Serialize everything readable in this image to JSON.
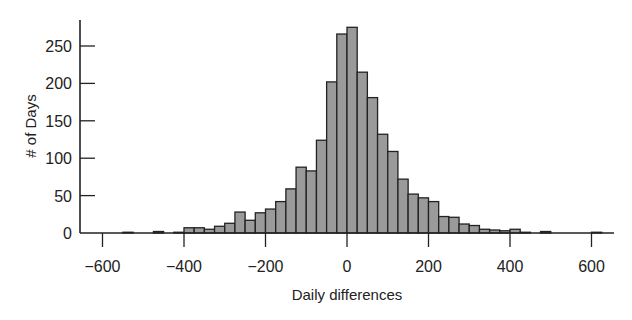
{
  "chart_data": {
    "type": "bar",
    "subtype": "histogram",
    "title": "",
    "xlabel": "Daily differences",
    "ylabel": "# of Days",
    "bin_width": 25,
    "xlim": [
      -650,
      650
    ],
    "ylim": [
      0,
      280
    ],
    "xticks": [
      -600,
      -400,
      -200,
      0,
      200,
      400,
      600
    ],
    "xtick_labels": [
      "−600",
      "−400",
      "−200",
      "0",
      "200",
      "400",
      "600"
    ],
    "yticks": [
      0,
      50,
      100,
      150,
      200,
      250
    ],
    "ytick_labels": [
      "0",
      "50",
      "100",
      "150",
      "200",
      "250"
    ],
    "grid": false,
    "legend": null,
    "bar_fill": "#9a9a9a",
    "bar_edge": "#222222",
    "bins": [
      {
        "start": -550,
        "end": -525,
        "count": 1
      },
      {
        "start": -475,
        "end": -450,
        "count": 2
      },
      {
        "start": -425,
        "end": -400,
        "count": 1
      },
      {
        "start": -400,
        "end": -375,
        "count": 7
      },
      {
        "start": -375,
        "end": -350,
        "count": 7
      },
      {
        "start": -350,
        "end": -325,
        "count": 5
      },
      {
        "start": -325,
        "end": -300,
        "count": 9
      },
      {
        "start": -300,
        "end": -275,
        "count": 13
      },
      {
        "start": -275,
        "end": -250,
        "count": 28
      },
      {
        "start": -250,
        "end": -225,
        "count": 17
      },
      {
        "start": -225,
        "end": -200,
        "count": 27
      },
      {
        "start": -200,
        "end": -175,
        "count": 32
      },
      {
        "start": -175,
        "end": -150,
        "count": 42
      },
      {
        "start": -150,
        "end": -125,
        "count": 59
      },
      {
        "start": -125,
        "end": -100,
        "count": 88
      },
      {
        "start": -100,
        "end": -75,
        "count": 83
      },
      {
        "start": -75,
        "end": -50,
        "count": 124
      },
      {
        "start": -50,
        "end": -25,
        "count": 202
      },
      {
        "start": -25,
        "end": 0,
        "count": 266
      },
      {
        "start": 0,
        "end": 25,
        "count": 275
      },
      {
        "start": 25,
        "end": 50,
        "count": 215
      },
      {
        "start": 50,
        "end": 75,
        "count": 181
      },
      {
        "start": 75,
        "end": 100,
        "count": 132
      },
      {
        "start": 100,
        "end": 125,
        "count": 109
      },
      {
        "start": 125,
        "end": 150,
        "count": 72
      },
      {
        "start": 150,
        "end": 175,
        "count": 52
      },
      {
        "start": 175,
        "end": 200,
        "count": 47
      },
      {
        "start": 200,
        "end": 225,
        "count": 42
      },
      {
        "start": 225,
        "end": 250,
        "count": 22
      },
      {
        "start": 250,
        "end": 275,
        "count": 21
      },
      {
        "start": 275,
        "end": 300,
        "count": 12
      },
      {
        "start": 300,
        "end": 325,
        "count": 10
      },
      {
        "start": 325,
        "end": 350,
        "count": 5
      },
      {
        "start": 350,
        "end": 375,
        "count": 4
      },
      {
        "start": 375,
        "end": 400,
        "count": 3
      },
      {
        "start": 400,
        "end": 425,
        "count": 5
      },
      {
        "start": 425,
        "end": 450,
        "count": 1
      },
      {
        "start": 475,
        "end": 500,
        "count": 2
      },
      {
        "start": 600,
        "end": 625,
        "count": 1
      }
    ]
  }
}
